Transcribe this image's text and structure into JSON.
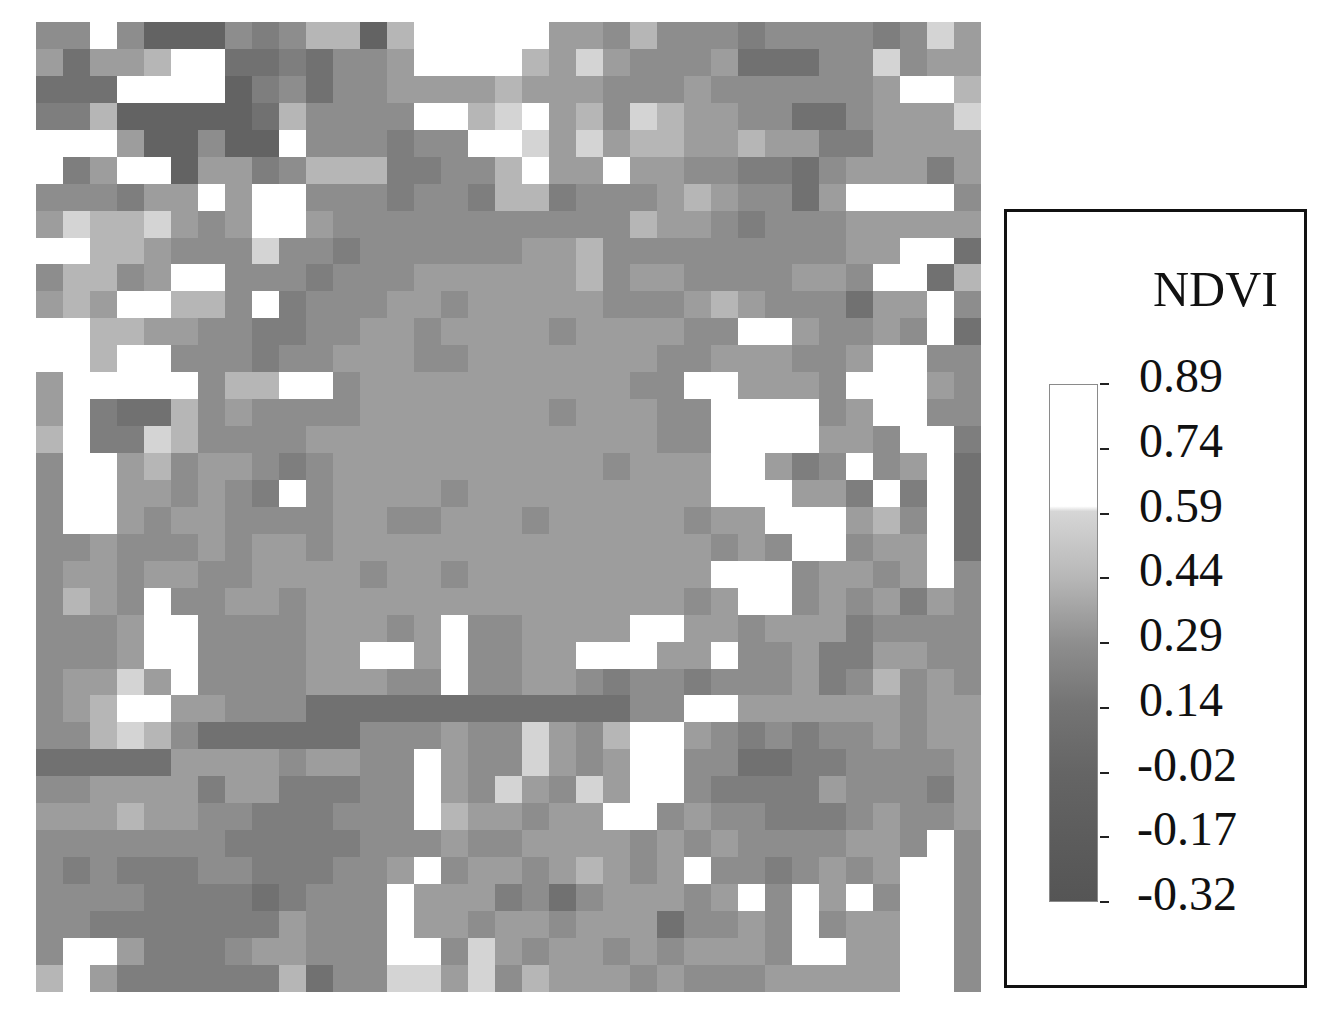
{
  "chart_data": {
    "type": "heatmap",
    "title": "",
    "colorbar_label": "NDVI",
    "colorbar_ticks": [
      "0.89",
      "0.74",
      "0.59",
      "0.44",
      "0.29",
      "0.14",
      "-0.02",
      "-0.17",
      "-0.32"
    ],
    "value_range": [
      -0.32,
      0.89
    ],
    "grid_shape": [
      36,
      35
    ],
    "encoding": "Each row string encodes 35 cells, digit 0 (darkest, low NDVI) to 9 (white, high NDVI)",
    "level_colors": [
      "#4a4a4a",
      "#575757",
      "#636363",
      "#717171",
      "#7e7e7e",
      "#8d8d8d",
      "#9d9d9d",
      "#b6b6b6",
      "#d4d4d4",
      "#ffffff"
    ],
    "rows": [
      "55952225457727999996657555455554586",
      "63667993343556999976865556333558566",
      "33399992453556666766655565555556997",
      "44722222375555997896758766553356668",
      "99962252295554559986867766766446666",
      "94699266457774455796696655443566646",
      "55546696995554554774555676553699995",
      "68778656996555555555557665455566666",
      "99776555855455555566755555555566993",
      "57756995554555666666756655556659937",
      "67699775945556656666655567655536695",
      "99776655445566566665666655996556593",
      "99799555455666556666666556665569955",
      "69999957799566666666665599666599965",
      "69433756555566666665666559999569955",
      "79448755556666666666666559999665994",
      "59967566545666666666656669964595693",
      "59966565495666656666666669996649493",
      "59965665555665566656666656699967593",
      "55655565665666666666666665659956693",
      "56656655666656656666666669995665695",
      "57659556656666666666666656995656465",
      "55569955556665695566669966566645555",
      "55569955556699695566999669556446655",
      "56686955556665595566545545556457565",
      "56799665553333333333335599666666566",
      "55787533333355565586579965454556566",
      "33333666656655965586569955334455556",
      "55666646644455965865869954444655546",
      "66676655444555976656699565544456556",
      "55555554444455565566665656555566595",
      "54544455444556956656765695545656995",
      "55554444345559666453566656959695995",
      "55444444465559665665666355659566995",
      "59964445665559958656656566659966995",
      "79644444473558868576665655566666995"
    ]
  },
  "legend": {
    "title": "NDVI",
    "ticks": [
      "0.89",
      "0.74",
      "0.59",
      "0.44",
      "0.29",
      "0.14",
      "-0.02",
      "-0.17",
      "-0.32"
    ]
  }
}
